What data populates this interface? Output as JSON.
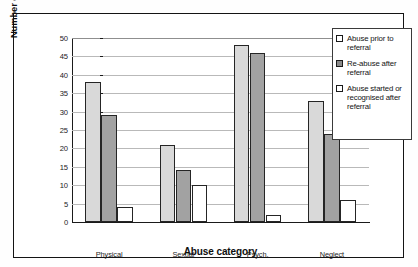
{
  "chart_data": {
    "type": "bar",
    "title": "",
    "xlabel": "Abuse category",
    "ylabel": "Number of children",
    "categories": [
      "Physical",
      "Sexual",
      "Psych.",
      "Neglect"
    ],
    "series": [
      {
        "name": "Abuse prior to referral",
        "values": [
          38,
          21,
          48,
          33
        ],
        "color": "#d9d9d9"
      },
      {
        "name": "Re-abuse after referral",
        "values": [
          29,
          14,
          46,
          24
        ],
        "color": "#a2a2a2"
      },
      {
        "name": "Abuse started or recognised after referral",
        "values": [
          4,
          10,
          2,
          6
        ],
        "color": "#ffffff"
      }
    ],
    "ylim": [
      0,
      50
    ],
    "ytick_step": 5,
    "yticks": [
      0,
      5,
      10,
      15,
      20,
      25,
      30,
      35,
      40,
      45,
      50
    ],
    "ytick_labels": [
      "0",
      "5",
      "10",
      "15",
      "20",
      "25",
      "30",
      "35",
      "40",
      "45",
      "50"
    ],
    "grid": "horizontal",
    "legend_position": "right"
  },
  "legend": {
    "entries": [
      {
        "label": "Abuse prior to referral"
      },
      {
        "label": "Re-abuse after referral"
      },
      {
        "label": "Abuse started or recognised after referral"
      }
    ]
  }
}
